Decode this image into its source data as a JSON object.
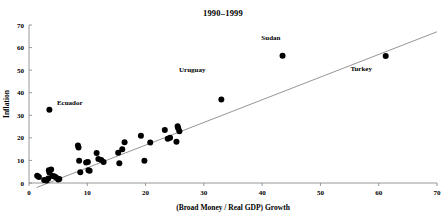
{
  "chart_data": {
    "type": "scatter",
    "title": "1990–1999",
    "xlabel": "(Broad Money / Real GDP) Growth",
    "ylabel": "Inflation",
    "xlim": [
      0,
      70
    ],
    "ylim": [
      0,
      70
    ],
    "xticks": [
      0,
      10,
      20,
      30,
      40,
      50,
      60,
      70
    ],
    "yticks": [
      0,
      10,
      20,
      30,
      40,
      50,
      60,
      70
    ],
    "grid": false,
    "legend": "none",
    "marker_color": "#000000",
    "trendline_color": "#7a7a7a",
    "axis_color": "#8d8d8d",
    "points": [
      {
        "x": 1.4,
        "y": 3.2,
        "label": ""
      },
      {
        "x": 1.7,
        "y": 2.7,
        "label": ""
      },
      {
        "x": 2.6,
        "y": 1.3,
        "label": ""
      },
      {
        "x": 3.0,
        "y": 1.1,
        "label": ""
      },
      {
        "x": 3.3,
        "y": 2.0,
        "label": ""
      },
      {
        "x": 3.4,
        "y": 5.6,
        "label": ""
      },
      {
        "x": 3.5,
        "y": 4.6,
        "label": ""
      },
      {
        "x": 3.5,
        "y": 32.5,
        "label": "Ecuador"
      },
      {
        "x": 3.8,
        "y": 6.0,
        "label": ""
      },
      {
        "x": 4.0,
        "y": 3.1,
        "label": ""
      },
      {
        "x": 4.3,
        "y": 3.0,
        "label": ""
      },
      {
        "x": 4.6,
        "y": 2.6,
        "label": ""
      },
      {
        "x": 5.0,
        "y": 1.6,
        "label": ""
      },
      {
        "x": 5.2,
        "y": 1.8,
        "label": ""
      },
      {
        "x": 8.4,
        "y": 16.6,
        "label": ""
      },
      {
        "x": 8.5,
        "y": 15.7,
        "label": ""
      },
      {
        "x": 8.6,
        "y": 9.9,
        "label": ""
      },
      {
        "x": 8.8,
        "y": 4.8,
        "label": ""
      },
      {
        "x": 9.8,
        "y": 9.1,
        "label": ""
      },
      {
        "x": 10.1,
        "y": 9.3,
        "label": ""
      },
      {
        "x": 10.2,
        "y": 5.6,
        "label": ""
      },
      {
        "x": 10.4,
        "y": 5.4,
        "label": ""
      },
      {
        "x": 11.6,
        "y": 13.3,
        "label": ""
      },
      {
        "x": 11.9,
        "y": 10.6,
        "label": ""
      },
      {
        "x": 12.4,
        "y": 10.2,
        "label": ""
      },
      {
        "x": 12.8,
        "y": 9.3,
        "label": ""
      },
      {
        "x": 15.3,
        "y": 13.4,
        "label": ""
      },
      {
        "x": 15.5,
        "y": 8.7,
        "label": ""
      },
      {
        "x": 16.0,
        "y": 14.9,
        "label": ""
      },
      {
        "x": 16.4,
        "y": 18.1,
        "label": ""
      },
      {
        "x": 19.2,
        "y": 20.9,
        "label": ""
      },
      {
        "x": 19.8,
        "y": 9.9,
        "label": ""
      },
      {
        "x": 20.8,
        "y": 17.9,
        "label": ""
      },
      {
        "x": 23.3,
        "y": 23.5,
        "label": ""
      },
      {
        "x": 23.8,
        "y": 19.6,
        "label": ""
      },
      {
        "x": 24.2,
        "y": 20.1,
        "label": ""
      },
      {
        "x": 25.3,
        "y": 18.3,
        "label": ""
      },
      {
        "x": 25.5,
        "y": 25.1,
        "label": ""
      },
      {
        "x": 25.6,
        "y": 24.3,
        "label": ""
      },
      {
        "x": 25.8,
        "y": 22.9,
        "label": ""
      },
      {
        "x": 33.0,
        "y": 37.0,
        "label": "Uruguay"
      },
      {
        "x": 43.5,
        "y": 56.4,
        "label": "Sudan"
      },
      {
        "x": 61.2,
        "y": 56.3,
        "label": "Turkey"
      }
    ],
    "annotations": [
      {
        "text": "Ecuador",
        "x": 7.0,
        "y": 34.5
      },
      {
        "text": "Uruguay",
        "x": 28.0,
        "y": 49.0
      },
      {
        "text": "Sudan",
        "x": 41.5,
        "y": 63.5
      },
      {
        "text": "Turkey",
        "x": 57.0,
        "y": 49.5
      }
    ],
    "trendline": {
      "x0": 1.3,
      "y0": -2.0,
      "x1": 70.0,
      "y1": 67.0
    }
  }
}
